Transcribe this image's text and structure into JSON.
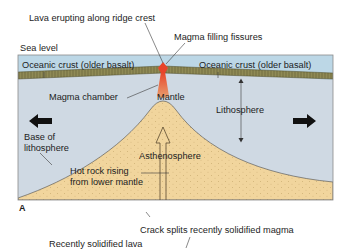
{
  "diagram": {
    "panel_label": "A",
    "colors": {
      "ocean": "#bcd7e6",
      "crust": "#8f8a55",
      "crust_texture": "#5f5a30",
      "lithosphere": "#cfd9e3",
      "asthenosphere": "#f1d59d",
      "asthenosphere_dots": "#b89a5c",
      "mantle_plume": "#d9693a",
      "lava": "#e8442a",
      "arrow": "#111111",
      "frame": "#8a8a8a"
    },
    "labels": {
      "lava_erupting": "Lava erupting along ridge crest",
      "magma_filling": "Magma filling fissures",
      "sea_level": "Sea level",
      "crust_left": "Oceanic crust (older basalt)",
      "crust_right": "Oceanic crust (older basalt)",
      "magma_chamber": "Magma chamber",
      "mantle": "Mantle",
      "lithosphere": "Lithosphere",
      "base_of_lithosphere_1": "Base of",
      "base_of_lithosphere_2": "lithosphere",
      "asthenosphere": "Asthenosphere",
      "hot_rock_1": "Hot rock rising",
      "hot_rock_2": "from lower mantle",
      "crack_splits": "Crack splits recently solidified magma",
      "recently_solidified": "Recently solidified lava"
    },
    "arrows": {
      "left": "plate-motion-left",
      "right": "plate-motion-right"
    }
  }
}
